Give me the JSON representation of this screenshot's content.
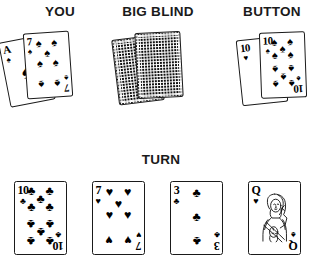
{
  "labels": {
    "you": "YOU",
    "big_blind": "BIG BLIND",
    "button": "BUTTON",
    "turn": "TURN"
  },
  "colors": {
    "ink": "#1a1a1a",
    "card_face": "#ffffff",
    "pattern": "#111111",
    "background": "#ffffff"
  },
  "glyphs": {
    "spade": "♠",
    "heart": "♥",
    "club": "♣",
    "diamond": "♦"
  },
  "hands": {
    "you": {
      "label": "YOU",
      "cards": [
        {
          "rank": "A",
          "suit": "spade",
          "suit_glyph": "♠",
          "face_up": true,
          "pip_count": 1
        },
        {
          "rank": "7",
          "suit": "spade",
          "suit_glyph": "♠",
          "face_up": true,
          "pip_count": 7
        }
      ]
    },
    "big_blind": {
      "label": "BIG BLIND",
      "cards": [
        {
          "rank": "",
          "suit": "",
          "suit_glyph": "",
          "face_up": false,
          "pip_count": 0
        },
        {
          "rank": "",
          "suit": "",
          "suit_glyph": "",
          "face_up": false,
          "pip_count": 0
        }
      ]
    },
    "button": {
      "label": "BUTTON",
      "cards": [
        {
          "rank": "10",
          "suit": "heart",
          "suit_glyph": "♥",
          "face_up": true,
          "pip_count": 10
        },
        {
          "rank": "10",
          "suit": "spade",
          "suit_glyph": "♠",
          "face_up": true,
          "pip_count": 10
        }
      ]
    }
  },
  "board": {
    "label": "TURN",
    "cards": [
      {
        "rank": "10",
        "suit": "club",
        "suit_glyph": "♣",
        "face_up": true,
        "pip_count": 10,
        "court": false
      },
      {
        "rank": "7",
        "suit": "heart",
        "suit_glyph": "♥",
        "face_up": true,
        "pip_count": 7,
        "court": false
      },
      {
        "rank": "3",
        "suit": "club",
        "suit_glyph": "♣",
        "face_up": true,
        "pip_count": 3,
        "court": false
      },
      {
        "rank": "Q",
        "suit": "heart",
        "suit_glyph": "♥",
        "face_up": true,
        "pip_count": 0,
        "court": true
      }
    ]
  }
}
